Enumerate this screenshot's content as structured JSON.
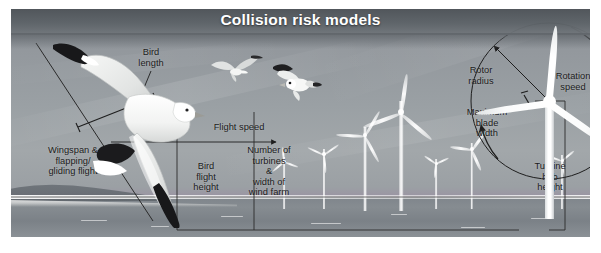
{
  "figure": {
    "title": "Collision risk models",
    "alt": "Diagram of collision risk model parameters for birds and offshore wind turbines"
  },
  "labels": {
    "bird_length": "Bird\nlength",
    "wingspan": "Wingspan &\nflapping/\ngliding flight",
    "flight_speed": "Flight speed",
    "bird_flight_height": "Bird\nflight\nheight",
    "turbine_count": "Number of\nturbines\n&\nwidth of\nwind farm",
    "rotor_radius": "Rotor\nradius",
    "rotation_speed": "Rotation\nspeed",
    "max_blade_width": "Maximum\nblade\nwidth",
    "hub_height": "Turbine\nhub\nheight"
  },
  "colors": {
    "title_text": "#ffffff",
    "header_band": "#5d6368",
    "label_text": "#1b1b1b",
    "annotation_line": "#2a2a2a",
    "sky": "#9a9fa3",
    "sea": "#82888e",
    "turbine": "#ffffff",
    "page_background": "#ffffff"
  },
  "elements": {
    "bird_count": 3,
    "turbine_count": 8,
    "primary_bird": "seagull",
    "scene": "offshore wind farm"
  }
}
